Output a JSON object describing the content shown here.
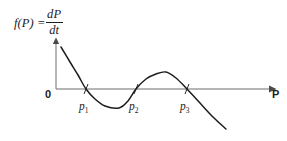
{
  "figure": {
    "background_color": "#ffffff",
    "ink_color": "#1c1c1c",
    "axis_color": "#6d6d6d"
  },
  "formula": {
    "lhs": "f(P) =",
    "numerator": "dP",
    "denominator": "dt",
    "full_text": "f(P) = dP/dt"
  },
  "axes": {
    "origin_label": "0",
    "x_axis_label": "P",
    "y_axis_label": "",
    "x_arrow": true,
    "y_arrow": true
  },
  "roots": [
    {
      "id": "p1",
      "label": "p",
      "subscript": "1"
    },
    {
      "id": "p2",
      "label": "p",
      "subscript": "2"
    },
    {
      "id": "p3",
      "label": "p",
      "subscript": "3"
    }
  ],
  "chart_data": {
    "type": "line",
    "title": "",
    "subtitle": "",
    "xlabel": "P",
    "ylabel": "f(P) = dP/dt",
    "grid": false,
    "legend": null,
    "axis_origin_label": "0",
    "xlim": [
      0,
      287
    ],
    "ylim": [
      -45,
      45
    ],
    "zero_crossings": [
      {
        "name": "p1",
        "x": 86,
        "y": 0
      },
      {
        "name": "p2",
        "x": 136,
        "y": 0
      },
      {
        "name": "p3",
        "x": 187,
        "y": 0
      }
    ],
    "extrema": [
      {
        "kind": "minimum",
        "x": 119,
        "y": -19
      },
      {
        "kind": "maximum",
        "x": 166,
        "y": 17
      }
    ],
    "series": [
      {
        "name": "f(P)",
        "color": "#1c1c1c",
        "points": [
          {
            "x": 61,
            "y": 42
          },
          {
            "x": 70,
            "y": 27
          },
          {
            "x": 78,
            "y": 14
          },
          {
            "x": 86,
            "y": 0
          },
          {
            "x": 95,
            "y": -10
          },
          {
            "x": 105,
            "y": -17
          },
          {
            "x": 119,
            "y": -19
          },
          {
            "x": 128,
            "y": -12
          },
          {
            "x": 136,
            "y": 0
          },
          {
            "x": 146,
            "y": 10
          },
          {
            "x": 156,
            "y": 15
          },
          {
            "x": 166,
            "y": 17
          },
          {
            "x": 176,
            "y": 11
          },
          {
            "x": 187,
            "y": 0
          },
          {
            "x": 200,
            "y": -14
          },
          {
            "x": 213,
            "y": -28
          },
          {
            "x": 226,
            "y": -40
          }
        ]
      }
    ],
    "annotations": [
      {
        "text": "p1",
        "x": 86,
        "y": -8,
        "placement": "below-axis"
      },
      {
        "text": "p2",
        "x": 136,
        "y": -8,
        "placement": "below-axis"
      },
      {
        "text": "p3",
        "x": 187,
        "y": -8,
        "placement": "below-axis"
      },
      {
        "text": "0",
        "x": 56,
        "y": -5,
        "placement": "origin"
      },
      {
        "text": "P",
        "x": 276,
        "y": -5,
        "placement": "x-axis-end"
      }
    ]
  }
}
